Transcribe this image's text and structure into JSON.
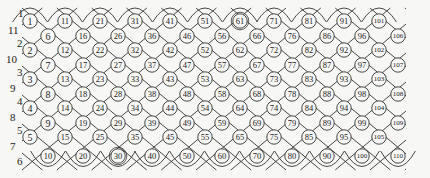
{
  "diagram": {
    "type": "diamond-lattice of circled numbered cells",
    "line_color": "#333333",
    "background": "#f7f7f5",
    "left_labels": [
      {
        "text": "1",
        "x": 18,
        "y": 17
      },
      {
        "text": "11",
        "x": 8,
        "y": 34
      },
      {
        "text": "2",
        "x": 17,
        "y": 47
      },
      {
        "text": "10",
        "x": 6,
        "y": 63
      },
      {
        "text": "3",
        "x": 17,
        "y": 76
      },
      {
        "text": "9",
        "x": 10,
        "y": 92
      },
      {
        "text": "4",
        "x": 17,
        "y": 105
      },
      {
        "text": "8",
        "x": 10,
        "y": 121
      },
      {
        "text": "5",
        "x": 17,
        "y": 134
      },
      {
        "text": "7",
        "x": 10,
        "y": 150
      },
      {
        "text": "6",
        "x": 17,
        "y": 165
      }
    ],
    "columns_a_x": [
      30,
      65,
      100,
      135,
      170,
      205,
      240,
      274,
      309,
      344,
      379
    ],
    "columns_a_rows_y": [
      21,
      50,
      79,
      108,
      137
    ],
    "columns_b_x": [
      48,
      83,
      118,
      152,
      187,
      222,
      257,
      292,
      327,
      362,
      398
    ],
    "columns_b_rows_y": [
      36,
      65,
      94,
      123,
      156
    ],
    "cells_a": [
      [
        1,
        2,
        3,
        4,
        5
      ],
      [
        11,
        12,
        13,
        14,
        15
      ],
      [
        21,
        22,
        23,
        24,
        25
      ],
      [
        31,
        32,
        33,
        34,
        35
      ],
      [
        41,
        42,
        43,
        44,
        45
      ],
      [
        51,
        52,
        53,
        54,
        55
      ],
      [
        61,
        62,
        63,
        64,
        65
      ],
      [
        71,
        72,
        73,
        74,
        75
      ],
      [
        81,
        82,
        83,
        84,
        85
      ],
      [
        91,
        92,
        93,
        94,
        95
      ],
      [
        101,
        102,
        103,
        104,
        105
      ]
    ],
    "cells_b": [
      [
        6,
        7,
        8,
        9,
        10
      ],
      [
        16,
        17,
        18,
        19,
        20
      ],
      [
        26,
        27,
        28,
        29,
        30
      ],
      [
        36,
        37,
        38,
        39,
        40
      ],
      [
        46,
        47,
        48,
        49,
        50
      ],
      [
        56,
        57,
        58,
        59,
        60
      ],
      [
        66,
        67,
        68,
        69,
        70
      ],
      [
        76,
        77,
        78,
        79,
        80
      ],
      [
        86,
        87,
        88,
        89,
        90
      ],
      [
        96,
        97,
        98,
        99,
        100
      ],
      [
        106,
        107,
        108,
        109,
        110
      ]
    ],
    "double_circled": [
      30,
      61
    ]
  }
}
